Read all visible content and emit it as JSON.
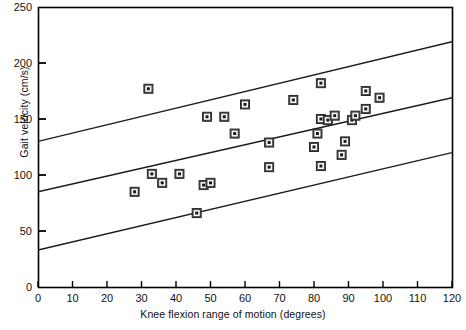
{
  "chart_data": {
    "type": "scatter",
    "title": "",
    "xlabel": "Knee flexion range of motion (degrees)",
    "ylabel": "Gait velocity (cm/s)",
    "xlim": [
      0,
      120
    ],
    "ylim": [
      0,
      250
    ],
    "xticks": [
      0,
      10,
      20,
      30,
      40,
      50,
      60,
      70,
      80,
      90,
      100,
      110,
      120
    ],
    "yticks": [
      0,
      50,
      100,
      150,
      200,
      250
    ],
    "grid": false,
    "legend": null,
    "points": [
      {
        "x": 32,
        "y": 177
      },
      {
        "x": 28,
        "y": 85
      },
      {
        "x": 33,
        "y": 101
      },
      {
        "x": 36,
        "y": 93
      },
      {
        "x": 41,
        "y": 101
      },
      {
        "x": 46,
        "y": 66
      },
      {
        "x": 48,
        "y": 91
      },
      {
        "x": 50,
        "y": 93
      },
      {
        "x": 49,
        "y": 152
      },
      {
        "x": 54,
        "y": 152
      },
      {
        "x": 60,
        "y": 163
      },
      {
        "x": 57,
        "y": 137
      },
      {
        "x": 67,
        "y": 129
      },
      {
        "x": 67,
        "y": 107
      },
      {
        "x": 74,
        "y": 167
      },
      {
        "x": 82,
        "y": 182
      },
      {
        "x": 82,
        "y": 150
      },
      {
        "x": 81,
        "y": 137
      },
      {
        "x": 80,
        "y": 125
      },
      {
        "x": 82,
        "y": 108
      },
      {
        "x": 84,
        "y": 149
      },
      {
        "x": 86,
        "y": 153
      },
      {
        "x": 88,
        "y": 118
      },
      {
        "x": 89,
        "y": 130
      },
      {
        "x": 91,
        "y": 149
      },
      {
        "x": 92,
        "y": 153
      },
      {
        "x": 95,
        "y": 159
      },
      {
        "x": 95,
        "y": 175
      },
      {
        "x": 99,
        "y": 169
      }
    ],
    "lines": [
      {
        "name": "upper-prediction-limit",
        "x1": 0,
        "y1": 130,
        "x2": 120,
        "y2": 219
      },
      {
        "name": "regression-line",
        "x1": 0,
        "y1": 85,
        "x2": 120,
        "y2": 169
      },
      {
        "name": "lower-prediction-limit",
        "x1": 0,
        "y1": 33,
        "x2": 120,
        "y2": 120
      }
    ]
  }
}
